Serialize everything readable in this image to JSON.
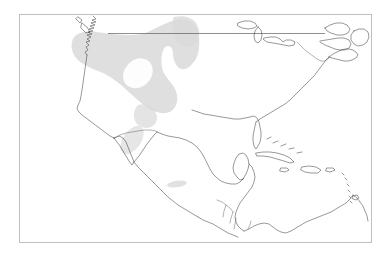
{
  "figure": {
    "background_color": "#ffffff",
    "width": 388,
    "height": 260
  },
  "axes": {
    "frame_color": "#bfbfbf",
    "frame_linewidth": 1,
    "facecolor": "#ffffff",
    "left": 19,
    "top": 14,
    "width": 353,
    "height": 229,
    "xlim": [
      -170.0,
      -52.0
    ],
    "ylim": [
      5.0,
      62.0
    ],
    "grid": false,
    "tick_labels_visible": false,
    "title": "",
    "xlabel": "",
    "ylabel": ""
  },
  "layers": {
    "coastline": {
      "name": "coastline",
      "color": "#1a1a1a",
      "linewidth": 0.45
    },
    "borders": {
      "name": "country-borders",
      "color": "#555555",
      "linewidth": 0.45
    },
    "range_polygon": {
      "name": "species-range-polygon",
      "fill_color": "#d9d9d9",
      "opacity": 0.85,
      "edge": "none",
      "description": "shaded distribution range over western North America"
    },
    "range_polygon_secondary": {
      "name": "species-range-polygon-secondary",
      "fill_color": "#dcdcdc",
      "opacity": 0.75,
      "description": "small disjunct patches over Baja California and central Mexico"
    }
  },
  "chart_data": {
    "type": "map",
    "title": "",
    "projection": "PlateCarree",
    "region": "North America, Central America and the Caribbean",
    "legend": null,
    "annotations": [],
    "features": [
      "coastline",
      "country-borders",
      "shaded-range-polygon"
    ]
  }
}
